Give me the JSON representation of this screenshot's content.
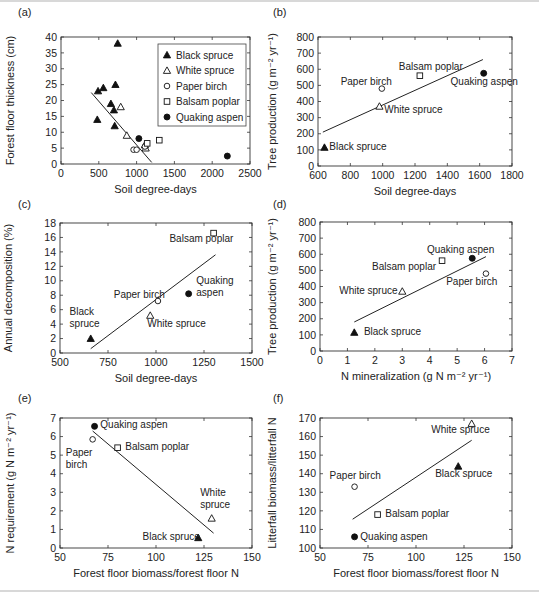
{
  "figure": {
    "panels": [
      "(a)",
      "(b)",
      "(c)",
      "(d)",
      "(e)",
      "(f)"
    ]
  },
  "legend": {
    "entries": [
      {
        "label": "Black spruce",
        "marker": "filled-triangle"
      },
      {
        "label": "White spruce",
        "marker": "open-triangle"
      },
      {
        "label": "Paper birch",
        "marker": "open-circle"
      },
      {
        "label": "Balsam poplar",
        "marker": "open-square"
      },
      {
        "label": "Quaking aspen",
        "marker": "filled-circle"
      }
    ]
  },
  "chart_data": [
    {
      "panel": "(a)",
      "type": "scatter",
      "xlabel": "Soil degree-days",
      "ylabel": "Forest floor thickness (cm)",
      "xlim": [
        0,
        2500
      ],
      "ylim": [
        0,
        40
      ],
      "xticks": [
        0,
        500,
        1000,
        1500,
        2000,
        2500
      ],
      "yticks": [
        0,
        5,
        10,
        15,
        20,
        25,
        30,
        35,
        40
      ],
      "legend_position": "upper right",
      "series": [
        {
          "name": "Black spruce",
          "marker": "filled-triangle",
          "points": [
            [
              480,
              14
            ],
            [
              490,
              23
            ],
            [
              560,
              24
            ],
            [
              660,
              19
            ],
            [
              700,
              17
            ],
            [
              710,
              12
            ],
            [
              720,
              25
            ],
            [
              750,
              38
            ]
          ]
        },
        {
          "name": "White spruce",
          "marker": "open-triangle",
          "points": [
            [
              790,
              18
            ],
            [
              870,
              9
            ],
            [
              1120,
              5
            ],
            [
              1110,
              6
            ]
          ]
        },
        {
          "name": "Paper birch",
          "marker": "open-circle",
          "points": [
            [
              960,
              4.5
            ],
            [
              1000,
              4.5
            ],
            [
              1110,
              5.5
            ]
          ]
        },
        {
          "name": "Balsam poplar",
          "marker": "open-square",
          "points": [
            [
              1140,
              6.5
            ],
            [
              1300,
              7.5
            ]
          ]
        },
        {
          "name": "Quaking aspen",
          "marker": "filled-circle",
          "points": [
            [
              1030,
              8
            ],
            [
              2200,
              2.5
            ]
          ]
        }
      ],
      "fit_line": [
        [
          400,
          22.5
        ],
        [
          1200,
          0.5
        ]
      ]
    },
    {
      "panel": "(b)",
      "type": "scatter",
      "xlabel": "Soil degree-days",
      "ylabel": "Tree production (g m⁻² yr⁻¹)",
      "xlim": [
        600,
        1800
      ],
      "ylim": [
        0,
        800
      ],
      "xticks": [
        600,
        800,
        1000,
        1200,
        1400,
        1600,
        1800
      ],
      "yticks": [
        0,
        100,
        200,
        300,
        400,
        500,
        600,
        700,
        800
      ],
      "series": [
        {
          "name": "Black spruce",
          "marker": "filled-triangle",
          "points": [
            [
              640,
              115
            ]
          ],
          "label": "Black spruce",
          "label_pos": [
            670,
            100
          ]
        },
        {
          "name": "White spruce",
          "marker": "open-triangle",
          "points": [
            [
              980,
              370
            ]
          ],
          "label": "White spruce",
          "label_pos": [
            1010,
            330
          ]
        },
        {
          "name": "Paper birch",
          "marker": "open-circle",
          "points": [
            [
              995,
              480
            ]
          ],
          "label": "Paper birch",
          "label_pos": [
            740,
            505
          ]
        },
        {
          "name": "Balsam poplar",
          "marker": "open-square",
          "points": [
            [
              1230,
              560
            ]
          ],
          "label": "Balsam poplar",
          "label_pos": [
            1100,
            595
          ]
        },
        {
          "name": "Quaking aspen",
          "marker": "filled-circle",
          "points": [
            [
              1625,
              575
            ]
          ],
          "label": "Quaking aspen",
          "label_pos": [
            1420,
            500
          ]
        }
      ],
      "fit_line": [
        [
          630,
          210
        ],
        [
          1620,
          660
        ]
      ]
    },
    {
      "panel": "(c)",
      "type": "scatter",
      "xlabel": "Soil degree-days",
      "ylabel": "Annual decomposition (%)",
      "xlim": [
        500,
        1500
      ],
      "ylim": [
        0,
        18
      ],
      "xticks": [
        500,
        750,
        1000,
        1250,
        1500
      ],
      "yticks": [
        0,
        2,
        4,
        6,
        8,
        10,
        12,
        14,
        16,
        18
      ],
      "series": [
        {
          "name": "Black spruce",
          "marker": "filled-triangle",
          "points": [
            [
              660,
              2
            ]
          ],
          "label": [
            "Black",
            "spruce"
          ],
          "label_pos": [
            550,
            5.3
          ]
        },
        {
          "name": "White spruce",
          "marker": "open-triangle",
          "points": [
            [
              970,
              5.2
            ]
          ],
          "label": "White spruce",
          "label_pos": [
            955,
            3.6
          ]
        },
        {
          "name": "Paper birch",
          "marker": "open-circle",
          "points": [
            [
              1010,
              7.2
            ]
          ],
          "label": "Paper birch",
          "label_pos": [
            780,
            7.6
          ]
        },
        {
          "name": "Balsam poplar",
          "marker": "open-square",
          "points": [
            [
              1300,
              16.6
            ]
          ],
          "label": "Balsam poplar",
          "label_pos": [
            1070,
            15.4
          ]
        },
        {
          "name": "Quaking aspen",
          "marker": "filled-circle",
          "points": [
            [
              1170,
              8.2
            ]
          ],
          "label": [
            "Quaking",
            "aspen"
          ],
          "label_pos": [
            1210,
            9.5
          ]
        }
      ],
      "fit_line": [
        [
          660,
          0.6
        ],
        [
          1310,
          13.6
        ]
      ]
    },
    {
      "panel": "(d)",
      "type": "scatter",
      "xlabel": "N mineralization (g N m⁻² yr⁻¹)",
      "ylabel": "Tree production (g m⁻² yr⁻¹)",
      "xlim": [
        0,
        7
      ],
      "ylim": [
        0,
        800
      ],
      "xticks": [
        0,
        1,
        2,
        3,
        4,
        5,
        6,
        7
      ],
      "yticks": [
        0,
        100,
        200,
        300,
        400,
        500,
        600,
        700,
        800
      ],
      "series": [
        {
          "name": "Black spruce",
          "marker": "filled-triangle",
          "points": [
            [
              1.25,
              115
            ]
          ],
          "label": "Black spruce",
          "label_pos": [
            1.6,
            100
          ]
        },
        {
          "name": "White spruce",
          "marker": "open-triangle",
          "points": [
            [
              3.0,
              370
            ]
          ],
          "label": "White spruce",
          "label_pos": [
            0.7,
            355
          ]
        },
        {
          "name": "Paper birch",
          "marker": "open-circle",
          "points": [
            [
              6.05,
              480
            ]
          ],
          "label": "Paper birch",
          "label_pos": [
            4.6,
            410
          ]
        },
        {
          "name": "Balsam poplar",
          "marker": "open-square",
          "points": [
            [
              4.45,
              560
            ]
          ],
          "label": "Balsam poplar",
          "label_pos": [
            1.9,
            500
          ]
        },
        {
          "name": "Quaking aspen",
          "marker": "filled-circle",
          "points": [
            [
              5.55,
              575
            ]
          ],
          "label": "Quaking aspen",
          "label_pos": [
            3.9,
            610
          ]
        }
      ],
      "fit_line": [
        [
          1.25,
          180
        ],
        [
          6.05,
          585
        ]
      ]
    },
    {
      "panel": "(e)",
      "type": "scatter",
      "xlabel": "Forest floor biomass/forest floor N",
      "ylabel": "N requirement (g N m⁻² yr⁻¹)",
      "xlim": [
        50,
        150
      ],
      "ylim": [
        0,
        7
      ],
      "xticks": [
        50,
        75,
        100,
        125,
        150
      ],
      "yticks": [
        0,
        1,
        2,
        3,
        4,
        5,
        6,
        7
      ],
      "series": [
        {
          "name": "Black spruce",
          "marker": "filled-triangle",
          "points": [
            [
              122,
              0.55
            ]
          ],
          "label": "Black spruce",
          "label_pos": [
            93,
            0.45
          ]
        },
        {
          "name": "White spruce",
          "marker": "open-triangle",
          "points": [
            [
              129,
              1.6
            ]
          ],
          "label": [
            "White",
            "spruce"
          ],
          "label_pos": [
            123,
            2.8
          ]
        },
        {
          "name": "Paper birch",
          "marker": "open-circle",
          "points": [
            [
              67,
              5.85
            ]
          ],
          "label": [
            "Paper",
            "birch"
          ],
          "label_pos": [
            53,
            4.95
          ]
        },
        {
          "name": "Balsam poplar",
          "marker": "open-square",
          "points": [
            [
              80,
              5.4
            ]
          ],
          "label": "Balsam poplar",
          "label_pos": [
            84,
            5.3
          ]
        },
        {
          "name": "Quaking aspen",
          "marker": "filled-circle",
          "points": [
            [
              68,
              6.55
            ]
          ],
          "label": "Quaking aspen",
          "label_pos": [
            71,
            6.45
          ]
        }
      ],
      "fit_line": [
        [
          67,
          6.3
        ],
        [
          130,
          0.8
        ]
      ]
    },
    {
      "panel": "(f)",
      "type": "scatter",
      "xlabel": "Forest floor biomass/forest floor N",
      "ylabel": "Litterfall biomass/litterfall N",
      "xlim": [
        50,
        150
      ],
      "ylim": [
        100,
        170
      ],
      "xticks": [
        50,
        75,
        100,
        125,
        150
      ],
      "yticks": [
        100,
        110,
        120,
        130,
        140,
        150,
        160,
        170
      ],
      "series": [
        {
          "name": "Black spruce",
          "marker": "filled-triangle",
          "points": [
            [
              122,
              144
            ]
          ],
          "label": "Black spruce",
          "label_pos": [
            110,
            138.5
          ]
        },
        {
          "name": "White spruce",
          "marker": "open-triangle",
          "points": [
            [
              129,
              167
            ]
          ],
          "label": "White spruce",
          "label_pos": [
            108,
            162
          ]
        },
        {
          "name": "Paper birch",
          "marker": "open-circle",
          "points": [
            [
              68,
              133
            ]
          ],
          "label": "Paper birch",
          "label_pos": [
            55,
            137
          ]
        },
        {
          "name": "Balsam poplar",
          "marker": "open-square",
          "points": [
            [
              80,
              118
            ]
          ],
          "label": "Balsam poplar",
          "label_pos": [
            84,
            116.5
          ]
        },
        {
          "name": "Quaking aspen",
          "marker": "filled-circle",
          "points": [
            [
              68,
              106
            ]
          ],
          "label": "Quaking aspen",
          "label_pos": [
            71,
            104.5
          ]
        }
      ],
      "fit_line": [
        [
          67,
          115.5
        ],
        [
          129,
          158
        ]
      ]
    }
  ]
}
